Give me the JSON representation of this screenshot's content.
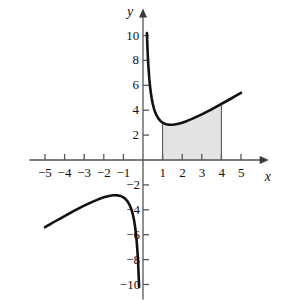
{
  "chart_data": {
    "type": "line",
    "title": "",
    "subtitle": "",
    "xlabel": "x",
    "ylabel": "y",
    "xlim": [
      -5.8,
      5.8
    ],
    "ylim": [
      -11.2,
      11.2
    ],
    "grid": false,
    "legend": null,
    "function_expression": "x + 2/x",
    "x_ticks": [
      -5,
      -4,
      -3,
      -2,
      -1,
      1,
      2,
      3,
      4,
      5
    ],
    "x_tick_labels": [
      "−5",
      "−4",
      "−3",
      "−2",
      "−1",
      "1",
      "2",
      "3",
      "4",
      "5"
    ],
    "y_ticks": [
      -10,
      -8,
      -6,
      -4,
      -2,
      2,
      4,
      6,
      8,
      10
    ],
    "y_tick_labels": [
      "−10",
      "−8",
      "−6",
      "−4",
      "−2",
      "2",
      "4",
      "6",
      "8",
      "10"
    ],
    "series": [
      {
        "name": "right-branch",
        "comment": "x > 0 branch of x + 2/x",
        "x": [
          0.2,
          0.22,
          0.25,
          0.28,
          0.32,
          0.36,
          0.4,
          0.45,
          0.5,
          0.56,
          0.63,
          0.7,
          0.8,
          0.9,
          1.0,
          1.1,
          1.2,
          1.3,
          1.414,
          1.5,
          1.6,
          1.8,
          2.0,
          2.25,
          2.5,
          2.75,
          3.0,
          3.25,
          3.5,
          3.75,
          4.0,
          4.25,
          4.5,
          4.75,
          5.0
        ],
        "y": [
          10.2,
          9.31,
          8.25,
          7.42,
          6.57,
          5.92,
          5.4,
          4.89,
          4.5,
          4.13,
          3.81,
          3.56,
          3.3,
          3.12,
          3.0,
          2.92,
          2.87,
          2.84,
          2.83,
          2.83,
          2.85,
          2.91,
          3.0,
          3.14,
          3.3,
          3.48,
          3.67,
          3.87,
          4.07,
          4.28,
          4.5,
          4.72,
          4.94,
          5.17,
          5.4
        ],
        "min_point": {
          "x": 1.414,
          "y": 2.83
        }
      },
      {
        "name": "left-branch",
        "comment": "x < 0 branch of x + 2/x",
        "x": [
          -5.0,
          -4.75,
          -4.5,
          -4.25,
          -4.0,
          -3.75,
          -3.5,
          -3.25,
          -3.0,
          -2.75,
          -2.5,
          -2.25,
          -2.0,
          -1.8,
          -1.6,
          -1.5,
          -1.414,
          -1.3,
          -1.2,
          -1.1,
          -1.0,
          -0.9,
          -0.8,
          -0.7,
          -0.63,
          -0.56,
          -0.5,
          -0.45,
          -0.4,
          -0.36,
          -0.32,
          -0.28,
          -0.25,
          -0.22,
          -0.2
        ],
        "y": [
          -5.4,
          -5.17,
          -4.94,
          -4.72,
          -4.5,
          -4.28,
          -4.07,
          -3.87,
          -3.67,
          -3.48,
          -3.3,
          -3.14,
          -3.0,
          -2.91,
          -2.85,
          -2.83,
          -2.83,
          -2.84,
          -2.87,
          -2.92,
          -3.0,
          -3.12,
          -3.3,
          -3.56,
          -3.81,
          -4.13,
          -4.5,
          -4.89,
          -5.4,
          -5.92,
          -6.57,
          -7.42,
          -8.25,
          -9.31,
          -10.2
        ],
        "max_point": {
          "x": -1.414,
          "y": -2.83
        }
      }
    ],
    "shaded_region": {
      "label": "",
      "x_start": 1,
      "x_end": 4,
      "y_lower": 0,
      "y_upper_curve": "x + 2/x",
      "fill_color": "#e3e3e3",
      "edge_color": "#4a4a4a"
    },
    "curve_color": "#111111",
    "axis_color": "#555555"
  },
  "axes": {
    "y_axis_name": "y",
    "x_axis_name": "x"
  }
}
